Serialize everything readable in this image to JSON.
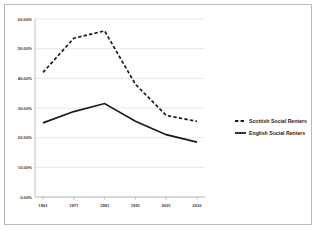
{
  "chart_data": {
    "type": "line",
    "title": "",
    "xlabel": "",
    "ylabel": "",
    "x": [
      "1961",
      "1971",
      "1981",
      "1991",
      "2001",
      "2010"
    ],
    "categories": [
      "1961",
      "1971",
      "1981",
      "1991",
      "2001",
      "2010"
    ],
    "ylim": [
      0,
      60
    ],
    "yticks": [
      0,
      10,
      20,
      30,
      40,
      50,
      60
    ],
    "ytick_labels": [
      "0.00%",
      "10.00%",
      "20.00%",
      "30.00%",
      "40.00%",
      "50.00%",
      "60.00%"
    ],
    "grid": true,
    "legend_position": "right",
    "series": [
      {
        "name": "Scottish Social Renters",
        "style": "dashed",
        "color": "#1a1a1a",
        "values": [
          42.0,
          53.5,
          56.0,
          38.0,
          27.5,
          25.5
        ]
      },
      {
        "name": "English Social Renters",
        "style": "solid",
        "color": "#1a1a1a",
        "values": [
          25.0,
          28.8,
          31.5,
          25.5,
          21.0,
          18.5
        ]
      }
    ],
    "legend": [
      {
        "label": "Scottish Social Renters",
        "style": "dashed"
      },
      {
        "label": "English Social Renters",
        "style": "solid"
      }
    ]
  }
}
